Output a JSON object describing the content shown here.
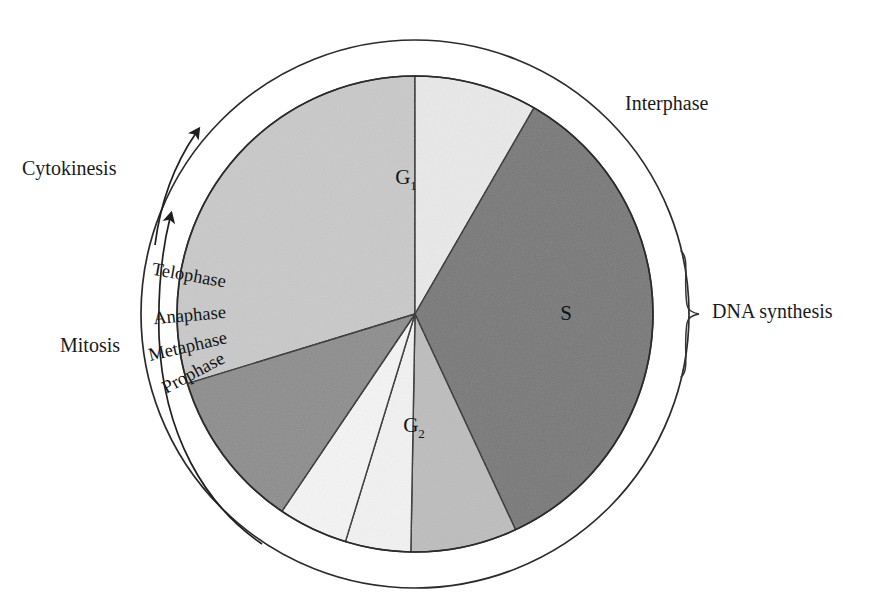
{
  "figure": {
    "center": {
      "x": 415,
      "y": 314
    },
    "inner_radius": 238,
    "outer_radius": 274,
    "background_color": "#ffffff",
    "outline_color": "#2b2b2b"
  },
  "chart_data": {
    "type": "pie",
    "title": "",
    "subtitle": "",
    "xlabel": "",
    "ylabel": "",
    "legend_position": "none",
    "grid": false,
    "note": "Angles are degrees measured clockwise from the 12 o'clock position; they sum to 360.",
    "categories": [
      "G1",
      "S",
      "G2",
      "Prophase",
      "Metaphase",
      "Anaphase",
      "Telophase"
    ],
    "values": [
      107,
      30,
      125,
      26,
      16,
      17,
      39
    ],
    "slices": [
      {
        "label": "G1",
        "display_label": "G",
        "subscript": "1",
        "start_angle": 253,
        "end_angle": 360,
        "sweep": 107,
        "color": "#c9c9c9",
        "label_x": 406,
        "label_y": 184,
        "label_rotation": 0
      },
      {
        "label": "S",
        "display_label": "S",
        "subscript": "",
        "start_angle": 0,
        "end_angle": 30,
        "sweep": 30,
        "color": "#e9e9e9",
        "label_x": 566,
        "label_y": 320,
        "label_rotation": 0
      },
      {
        "label": "G2",
        "display_label": "G",
        "subscript": "2",
        "start_angle": 30,
        "end_angle": 155,
        "sweep": 125,
        "color": "#787878",
        "label_x": 414,
        "label_y": 432,
        "label_rotation": 0
      },
      {
        "label": "Prophase",
        "display_label": "Prophase",
        "subscript": "",
        "start_angle": 155,
        "end_angle": 181,
        "sweep": 26,
        "color": "#bdbdbd",
        "label_x": 196,
        "label_y": 378,
        "label_rotation": -28
      },
      {
        "label": "Metaphase",
        "display_label": "Metaphase",
        "subscript": "",
        "start_angle": 181,
        "end_angle": 197,
        "sweep": 16,
        "color": "#f2f2f2",
        "label_x": 189,
        "label_y": 352,
        "label_rotation": -13
      },
      {
        "label": "Anaphase",
        "display_label": "Anaphase",
        "subscript": "",
        "start_angle": 197,
        "end_angle": 214,
        "sweep": 17,
        "color": "#f4f4f4",
        "label_x": 190,
        "label_y": 321,
        "label_rotation": -5
      },
      {
        "label": "Telophase",
        "display_label": "Telophase",
        "subscript": "",
        "start_angle": 214,
        "end_angle": 253,
        "sweep": 39,
        "color": "#8d8d8d",
        "label_x": 188,
        "label_y": 281,
        "label_rotation": 10
      }
    ]
  },
  "annotations": {
    "interphase": {
      "label": "Interphase",
      "x": 625,
      "y": 110
    },
    "dna_synthesis": {
      "label": "DNA synthesis",
      "x": 712,
      "y": 318,
      "brace_x": 686,
      "brace_top": 251,
      "brace_bottom": 376
    },
    "cytokinesis": {
      "label": "Cytokinesis",
      "x": 22,
      "y": 175
    },
    "mitosis": {
      "label": "Mitosis",
      "x": 60,
      "y": 352
    }
  },
  "arrows": {
    "cytokinesis_arrow": {
      "name": "cytokinesis-arrow",
      "description": "short curved arrow pointing clockwise toward top of cycle"
    },
    "mitosis_arrow": {
      "name": "mitosis-arrow",
      "description": "long curved arrow running along lower-left of cycle pointing upward"
    }
  }
}
